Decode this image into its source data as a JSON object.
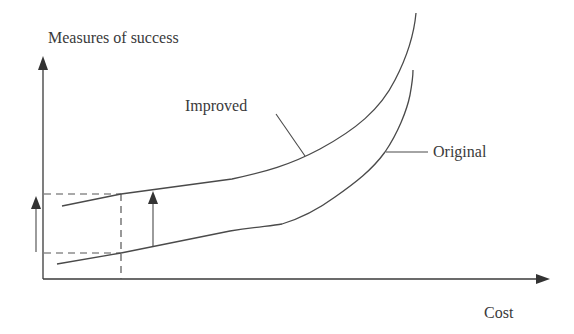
{
  "diagram": {
    "type": "cost-vs-success-curves",
    "y_axis_label": "Measures of success",
    "x_axis_label": "Cost",
    "curves": [
      {
        "name": "improved",
        "label": "Improved"
      },
      {
        "name": "original",
        "label": "Original"
      }
    ],
    "annotations": {
      "left_arrow": "increase in success at same cost (y-axis indicator)",
      "middle_arrow": "vertical shift from Original curve to Improved curve"
    },
    "colors": {
      "line": "#4a4a4a",
      "text": "#3a3a3a",
      "background": "#ffffff"
    }
  }
}
